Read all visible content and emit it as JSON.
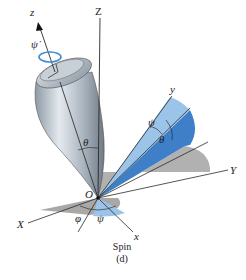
{
  "figure": {
    "caption": "Spin",
    "sublabel": "(d)",
    "labels": {
      "Z": "Z",
      "z": "z",
      "psi_dot": "ψ̇",
      "theta_body": "θ",
      "y": "y",
      "psi_upper": "ψ",
      "theta_plane": "θ",
      "Y": "Y",
      "O": "O",
      "phi": "φ",
      "psi_lower": "ψ",
      "X": "X",
      "x": "x"
    },
    "colors": {
      "axis": "#2a2a2a",
      "blue_dark": "#3f7fc8",
      "blue_light": "#9cc3e8",
      "gray_shade": "#a9a9a9",
      "body": "#b9c2cc",
      "spin_arrow": "#3a8ad6"
    }
  }
}
